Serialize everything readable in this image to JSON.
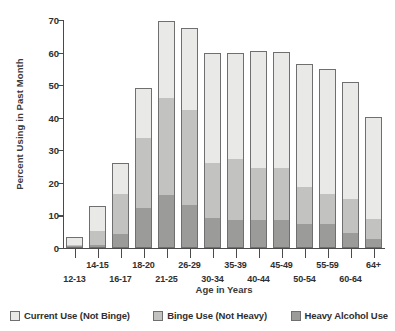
{
  "chart_data": {
    "type": "bar",
    "subtype": "stacked-bar",
    "title": "",
    "xlabel": "Age in Years",
    "ylabel": "Percent Using in Past Month",
    "ylim": [
      0,
      70
    ],
    "yticks": [
      0,
      10,
      20,
      30,
      40,
      50,
      60,
      70
    ],
    "ytick_labels": [
      "0",
      "10",
      "20",
      "30",
      "40",
      "50",
      "60",
      "70"
    ],
    "grid": false,
    "legend_position": "bottom",
    "categories": [
      "12-13",
      "14-15",
      "16-17",
      "18-20",
      "21-25",
      "26-29",
      "30-34",
      "35-39",
      "40-44",
      "45-49",
      "50-54",
      "55-59",
      "60-64",
      "64+"
    ],
    "series": [
      {
        "name": "Heavy Alcohol Use",
        "color": "#9b9b99",
        "values": [
          0.2,
          0.7,
          4.0,
          12.0,
          16.0,
          13.0,
          9.0,
          8.5,
          8.5,
          8.5,
          7.0,
          7.0,
          4.5,
          2.5
        ]
      },
      {
        "name": "Binge Use (Not Heavy)",
        "color": "#c2c2c0",
        "values": [
          0.6,
          4.6,
          12.8,
          21.8,
          30.1,
          29.6,
          17.0,
          18.8,
          16.0,
          16.0,
          11.5,
          9.5,
          10.3,
          6.3
        ]
      },
      {
        "name": "Current Use (Not Binge)",
        "color": "#e9e9e7",
        "values": [
          2.7,
          7.7,
          9.4,
          15.2,
          23.5,
          24.9,
          33.8,
          32.7,
          36.0,
          35.6,
          38.1,
          38.5,
          36.3,
          31.4
        ]
      }
    ],
    "totals": [
      3.5,
      13.0,
      26.2,
      49.0,
      69.6,
      67.5,
      59.8,
      60.0,
      60.5,
      60.1,
      56.6,
      55.0,
      51.1,
      40.2
    ],
    "annotations": []
  },
  "legend": {
    "items": [
      {
        "label": "Current Use (Not Binge)",
        "color": "#e9e9e7"
      },
      {
        "label": "Binge Use (Not Heavy)",
        "color": "#c2c2c0"
      },
      {
        "label": "Heavy Alcohol Use",
        "color": "#9b9b99"
      }
    ]
  },
  "axes": {
    "x_title": "Age in Years",
    "y_title": "Percent Using in Past Month"
  }
}
